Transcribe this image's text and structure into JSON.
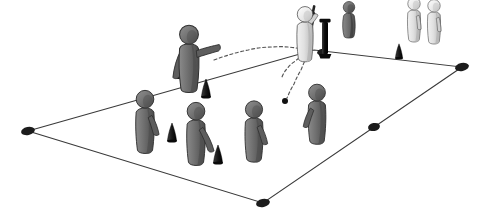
{
  "diagram": {
    "type": "sports-drill-diagram",
    "sport": "cricket-fielding-drill",
    "title": "",
    "background_color": "#ffffff",
    "canvas": {
      "width": 491,
      "height": 218
    }
  },
  "colors": {
    "field_line": "#3a3a3a",
    "corner_marker": "#1c1c1c",
    "dark_player_body": "#6e6e6e",
    "dark_player_shade": "#4f4f4f",
    "dark_player_outline": "#2f2f2f",
    "light_player_body": "#e2e2e2",
    "light_player_shade": "#bdbdbd",
    "light_player_outline": "#555555",
    "cone": "#1f1f1f",
    "stump": "#101010",
    "bat": "#1a1a1a",
    "ball": "#111111",
    "trajectory": "#555555"
  },
  "field": {
    "name": "playing-area",
    "shape": "quadrilateral",
    "corners": [
      {
        "label": "left-corner",
        "x": 28,
        "y": 131
      },
      {
        "label": "top-corner",
        "x": 314,
        "y": 50
      },
      {
        "label": "right-corner",
        "x": 462,
        "y": 67
      },
      {
        "label": "bottom-corner",
        "x": 263,
        "y": 203
      }
    ],
    "edge_markers": [
      {
        "label": "marker-left",
        "x": 28,
        "y": 131,
        "rx": 7,
        "ry": 4
      },
      {
        "label": "marker-top-left",
        "x": 180,
        "y": 76,
        "rx": 5,
        "ry": 3
      },
      {
        "label": "marker-top-right",
        "x": 322,
        "y": 52,
        "rx": 5,
        "ry": 3
      },
      {
        "label": "marker-right",
        "x": 462,
        "y": 67,
        "rx": 7,
        "ry": 4
      },
      {
        "label": "marker-right-lower",
        "x": 374,
        "y": 127,
        "rx": 6,
        "ry": 4
      },
      {
        "label": "marker-bottom",
        "x": 263,
        "y": 203,
        "rx": 7,
        "ry": 4
      }
    ]
  },
  "players": [
    {
      "id": "thrower",
      "role": "feeder-thrower",
      "tone": "dark",
      "x": 189,
      "y": 44,
      "scale": 1.12,
      "pose": "arms-extended-throwing",
      "arm_left": "down-angled",
      "arm_right": "extended-right"
    },
    {
      "id": "batter",
      "role": "batter",
      "tone": "light",
      "x": 305,
      "y": 22,
      "scale": 0.92,
      "pose": "standing-with-bat",
      "arm_left": "raised-holding-bat",
      "arm_right": "none"
    },
    {
      "id": "wicket-keeper",
      "role": "wicket-keeper",
      "tone": "dark",
      "x": 349,
      "y": 13,
      "scale": 0.72,
      "pose": "crouching",
      "arm_left": "tucked",
      "arm_right": "tucked"
    },
    {
      "id": "waiting-batter-1",
      "role": "waiting-player",
      "tone": "light",
      "x": 414,
      "y": 10,
      "scale": 0.74,
      "pose": "standing",
      "arm_left": "at-side",
      "arm_right": "at-side"
    },
    {
      "id": "waiting-batter-2",
      "role": "waiting-player",
      "tone": "light",
      "x": 434,
      "y": 12,
      "scale": 0.74,
      "pose": "standing",
      "arm_left": "at-side",
      "arm_right": "at-side"
    },
    {
      "id": "fielder-1",
      "role": "fielder",
      "tone": "dark",
      "x": 145,
      "y": 108,
      "scale": 1.05,
      "pose": "ready-stance",
      "arm_left": "none",
      "arm_right": "down-right"
    },
    {
      "id": "fielder-2",
      "role": "fielder",
      "tone": "dark",
      "x": 196,
      "y": 120,
      "scale": 1.05,
      "pose": "ready-stance",
      "arm_left": "none",
      "arm_right": "down-right-long"
    },
    {
      "id": "fielder-3",
      "role": "fielder",
      "tone": "dark",
      "x": 254,
      "y": 118,
      "scale": 1.02,
      "pose": "ready-stance",
      "arm_left": "none",
      "arm_right": "down-right"
    },
    {
      "id": "fielder-4",
      "role": "fielder",
      "tone": "dark",
      "x": 317,
      "y": 101,
      "scale": 1.0,
      "pose": "ready-stance",
      "arm_left": "none",
      "arm_right": "down-left"
    }
  ],
  "cones": [
    {
      "id": "cone-thrower",
      "x": 206,
      "y": 88,
      "scale": 1.0
    },
    {
      "id": "cone-fielder1",
      "x": 172,
      "y": 132,
      "scale": 1.0
    },
    {
      "id": "cone-fielder2",
      "x": 218,
      "y": 154,
      "scale": 1.0
    },
    {
      "id": "cone-sideline",
      "x": 399,
      "y": 51,
      "scale": 0.8
    }
  ],
  "equipment": {
    "bat": {
      "id": "cricket-bat",
      "x": 313,
      "y": 12,
      "angle": 12,
      "length": 34,
      "width": 6
    },
    "stumps": {
      "id": "wicket-stumps",
      "x": 325,
      "y": 22,
      "height": 32,
      "width": 6
    }
  },
  "ball": {
    "id": "ball",
    "x": 285,
    "y": 101,
    "r": 3
  },
  "trajectories": [
    {
      "id": "throw-path",
      "label": "throw-to-batter",
      "style": "dashed",
      "points": [
        [
          214,
          60
        ],
        [
          248,
          50
        ],
        [
          272,
          47
        ],
        [
          296,
          48
        ],
        [
          306,
          52
        ]
      ]
    },
    {
      "id": "deflection-path-left",
      "label": "deflection-to-left",
      "style": "dashed",
      "points": [
        [
          304,
          56
        ],
        [
          294,
          62
        ],
        [
          286,
          70
        ],
        [
          282,
          77
        ]
      ]
    },
    {
      "id": "hit-path-down",
      "label": "hit-ball-down",
      "style": "dashed",
      "points": [
        [
          307,
          57
        ],
        [
          301,
          70
        ],
        [
          294,
          84
        ],
        [
          287,
          98
        ]
      ]
    }
  ]
}
